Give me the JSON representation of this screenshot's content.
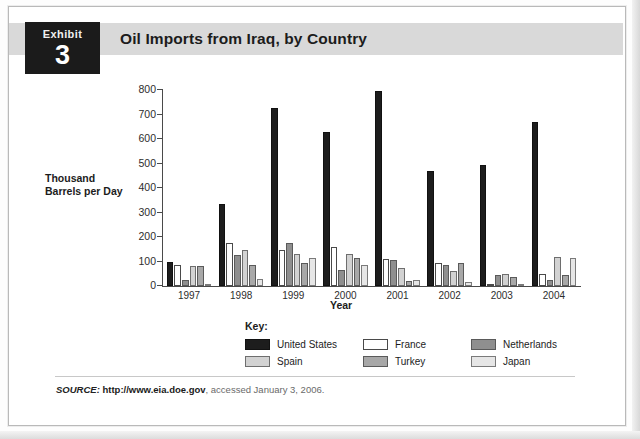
{
  "exhibit": {
    "word": "Exhibit",
    "number": "3"
  },
  "header": {
    "title": "Oil Imports from Iraq, by Country"
  },
  "source": {
    "prefix": "SOURCE:",
    "url": "http://www.eia.doe.gov",
    "rest": ", accessed January 3, 2006."
  },
  "legend": {
    "title": "Key:",
    "items": [
      {
        "label": "United States",
        "color": "#1d1d1d"
      },
      {
        "label": "France",
        "color": "#ffffff"
      },
      {
        "label": "Netherlands",
        "color": "#8f8f8f"
      },
      {
        "label": "Spain",
        "color": "#d2d2d2"
      },
      {
        "label": "Turkey",
        "color": "#a8a8a8"
      },
      {
        "label": "Japan",
        "color": "#e6e6e6"
      }
    ]
  },
  "chart_data": {
    "type": "bar",
    "title": "Oil Imports from Iraq, by Country",
    "xlabel": "Year",
    "ylabel": "Thousand Barrels per Day",
    "ylim": [
      0,
      800
    ],
    "yticks": [
      0,
      100,
      200,
      300,
      400,
      500,
      600,
      700,
      800
    ],
    "ytick_labels": [
      "0",
      "100",
      "200",
      "300",
      "400",
      "500",
      "600",
      "700",
      "800"
    ],
    "grid": false,
    "legend_position": "bottom",
    "categories": [
      "1997",
      "1998",
      "1999",
      "2000",
      "2001",
      "2002",
      "2003",
      "2004"
    ],
    "series": [
      {
        "name": "United States",
        "color": "#1d1d1d",
        "values": [
          100,
          335,
          725,
          630,
          795,
          470,
          495,
          670
        ]
      },
      {
        "name": "France",
        "color": "#ffffff",
        "values": [
          85,
          175,
          145,
          160,
          110,
          95,
          10,
          50
        ]
      },
      {
        "name": "Netherlands",
        "color": "#8f8f8f",
        "values": [
          25,
          125,
          175,
          65,
          105,
          85,
          45,
          25
        ]
      },
      {
        "name": "Spain",
        "color": "#d2d2d2",
        "values": [
          80,
          145,
          130,
          130,
          75,
          60,
          50,
          120
        ]
      },
      {
        "name": "Turkey",
        "color": "#a8a8a8",
        "values": [
          80,
          85,
          95,
          115,
          20,
          95,
          35,
          45
        ]
      },
      {
        "name": "Japan",
        "color": "#e6e6e6",
        "values": [
          10,
          30,
          115,
          85,
          25,
          15,
          10,
          115
        ]
      }
    ]
  }
}
